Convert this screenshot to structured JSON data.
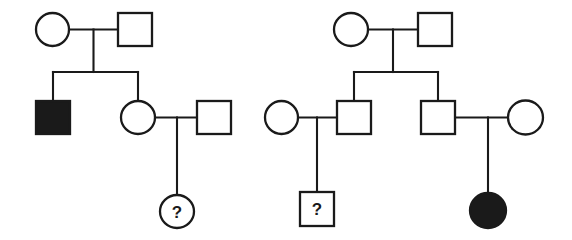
{
  "figure": {
    "type": "pedigree-chart",
    "width": 572,
    "height": 240,
    "background_color": "#ffffff",
    "line_color": "#1a1a1a",
    "affected_fill_color": "#1a1a1a",
    "unaffected_fill_color": "#ffffff"
  },
  "legend": {
    "square_meaning": "male",
    "circle_meaning": "female",
    "filled_meaning": "affected",
    "open_meaning": "unaffected",
    "question_mark_meaning": "unknown phenotype"
  },
  "pedigrees": [
    {
      "id": "pedigree-left",
      "name": "Left family",
      "generations": [
        {
          "id": "left-gen-1",
          "label": "I",
          "individuals": [
            {
              "id": "left-I-1",
              "shape": "circle",
              "sex": "female",
              "status": "unaffected",
              "label": "",
              "cx": 52.5,
              "cy": 29.5,
              "rx": 16.5,
              "ry": 16.5
            },
            {
              "id": "left-I-2",
              "shape": "square",
              "sex": "male",
              "status": "unaffected",
              "label": "",
              "x": 118,
              "y": 13,
              "w": 34,
              "h": 33
            }
          ]
        },
        {
          "id": "left-gen-2",
          "label": "II",
          "individuals": [
            {
              "id": "left-II-1",
              "shape": "square",
              "sex": "male",
              "status": "affected",
              "label": "",
              "x": 36,
              "y": 101,
              "w": 34,
              "h": 33
            },
            {
              "id": "left-II-2",
              "shape": "circle",
              "sex": "female",
              "status": "unaffected",
              "label": "",
              "cx": 138,
              "cy": 117.5,
              "rx": 17,
              "ry": 16.5
            },
            {
              "id": "left-II-3",
              "shape": "square",
              "sex": "male",
              "status": "unaffected",
              "label": "",
              "x": 197,
              "y": 101,
              "w": 34,
              "h": 33
            }
          ]
        },
        {
          "id": "left-gen-3",
          "label": "III",
          "individuals": [
            {
              "id": "left-III-1",
              "shape": "circle",
              "sex": "female",
              "status": "unknown",
              "label": "?",
              "cx": 177,
              "cy": 211.5,
              "rx": 17,
              "ry": 16.5
            }
          ]
        }
      ],
      "mating_lines": [
        {
          "id": "left-mate-1",
          "x1": 69,
          "y1": 29.5,
          "x2": 118,
          "y2": 29.5
        },
        {
          "id": "left-mate-2",
          "x1": 155,
          "y1": 117.5,
          "x2": 197,
          "y2": 117.5
        }
      ],
      "descent_lines": [
        {
          "id": "left-descent-1",
          "x1": 93.5,
          "y1": 29.5,
          "x2": 93.5,
          "y2": 72
        },
        {
          "id": "left-sibship-1",
          "x1": 53,
          "y1": 72,
          "x2": 138,
          "y2": 72
        },
        {
          "id": "left-drop-1",
          "x1": 53,
          "y1": 72,
          "x2": 53,
          "y2": 101
        },
        {
          "id": "left-drop-2",
          "x1": 138,
          "y1": 72,
          "x2": 138,
          "y2": 100.5
        },
        {
          "id": "left-descent-2",
          "x1": 177,
          "y1": 117.5,
          "x2": 177,
          "y2": 195
        }
      ]
    },
    {
      "id": "pedigree-right",
      "name": "Right family",
      "generations": [
        {
          "id": "right-gen-1",
          "label": "I",
          "individuals": [
            {
              "id": "right-I-1",
              "shape": "circle",
              "sex": "female",
              "status": "unaffected",
              "label": "",
              "cx": 351,
              "cy": 29.5,
              "rx": 17,
              "ry": 16.5
            },
            {
              "id": "right-I-2",
              "shape": "square",
              "sex": "male",
              "status": "unaffected",
              "label": "",
              "x": 418,
              "y": 13,
              "w": 34,
              "h": 33
            }
          ]
        },
        {
          "id": "right-gen-2",
          "label": "II",
          "individuals": [
            {
              "id": "right-II-1",
              "shape": "circle",
              "sex": "female",
              "status": "unaffected",
              "label": "",
              "cx": 281.5,
              "cy": 117.5,
              "rx": 16.5,
              "ry": 16.5
            },
            {
              "id": "right-II-2",
              "shape": "square",
              "sex": "male",
              "status": "unaffected",
              "label": "",
              "x": 337,
              "y": 101,
              "w": 34,
              "h": 33
            },
            {
              "id": "right-II-3",
              "shape": "square",
              "sex": "male",
              "status": "unaffected",
              "label": "",
              "x": 421,
              "y": 101,
              "w": 34,
              "h": 33
            },
            {
              "id": "right-II-4",
              "shape": "circle",
              "sex": "female",
              "status": "unaffected",
              "label": "",
              "cx": 525.5,
              "cy": 117.5,
              "rx": 17.5,
              "ry": 17
            }
          ]
        },
        {
          "id": "right-gen-3",
          "label": "III",
          "individuals": [
            {
              "id": "right-III-1",
              "shape": "square",
              "sex": "male",
              "status": "unknown",
              "label": "?",
              "x": 300,
              "y": 192,
              "w": 34,
              "h": 34
            },
            {
              "id": "right-III-2",
              "shape": "circle",
              "sex": "female",
              "status": "affected",
              "label": "",
              "cx": 488,
              "cy": 210.5,
              "rx": 18,
              "ry": 17.5
            }
          ]
        }
      ],
      "mating_lines": [
        {
          "id": "right-mate-1",
          "x1": 368,
          "y1": 29.5,
          "x2": 418,
          "y2": 29.5
        },
        {
          "id": "right-mate-2",
          "x1": 298,
          "y1": 117.5,
          "x2": 337,
          "y2": 117.5
        },
        {
          "id": "right-mate-3",
          "x1": 455,
          "y1": 117.5,
          "x2": 508,
          "y2": 117.5
        }
      ],
      "descent_lines": [
        {
          "id": "right-descent-1",
          "x1": 393,
          "y1": 29.5,
          "x2": 393,
          "y2": 72
        },
        {
          "id": "right-sibship-1",
          "x1": 354,
          "y1": 72,
          "x2": 438,
          "y2": 72
        },
        {
          "id": "right-drop-1",
          "x1": 354,
          "y1": 72,
          "x2": 354,
          "y2": 101
        },
        {
          "id": "right-drop-2",
          "x1": 438,
          "y1": 72,
          "x2": 438,
          "y2": 101
        },
        {
          "id": "right-descent-2",
          "x1": 317,
          "y1": 117.5,
          "x2": 317,
          "y2": 192
        },
        {
          "id": "right-descent-3",
          "x1": 488,
          "y1": 117.5,
          "x2": 488,
          "y2": 193
        }
      ]
    }
  ]
}
